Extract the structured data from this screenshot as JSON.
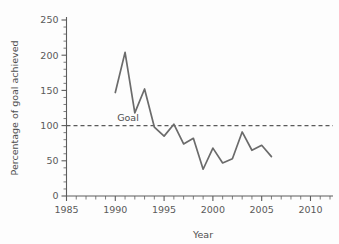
{
  "chart_data": {
    "type": "line",
    "title": "",
    "subtitle": "",
    "xlabel": "Year",
    "ylabel": "Percentage of goal achieved",
    "xlim": [
      1985,
      2012
    ],
    "ylim": [
      0,
      250
    ],
    "grid": false,
    "legend": null,
    "x_major_ticks": [
      1985,
      1990,
      1995,
      2000,
      2005,
      2010
    ],
    "x_major_tick_labels": [
      "1985",
      "1990",
      "1995",
      "2000",
      "2005",
      "2010"
    ],
    "x_minor_tick_step": 1,
    "y_major_ticks": [
      0,
      50,
      100,
      150,
      200,
      250
    ],
    "y_major_tick_labels": [
      "0",
      "50",
      "100",
      "150",
      "200",
      "250"
    ],
    "y_minor_tick_step": 10,
    "series": [
      {
        "name": "Percentage of goal achieved",
        "color": "#6b6b6b",
        "x": [
          1990,
          1991,
          1992,
          1993,
          1994,
          1995,
          1996,
          1997,
          1998,
          1999,
          2000,
          2001,
          2002,
          2003,
          2004,
          2005,
          2006
        ],
        "values": [
          147,
          204,
          118,
          152,
          98,
          85,
          102,
          74,
          82,
          38,
          68,
          47,
          53,
          91,
          65,
          72,
          56
        ]
      }
    ],
    "annotations": [
      {
        "name": "goal-reference-line",
        "label": "Goal",
        "y_value": 100,
        "style": "dashed",
        "color": "#5a5a5a",
        "label_x": 1991.3
      }
    ]
  },
  "axes": {
    "y_title": "Percentage of goal achieved",
    "x_title": "Year"
  }
}
